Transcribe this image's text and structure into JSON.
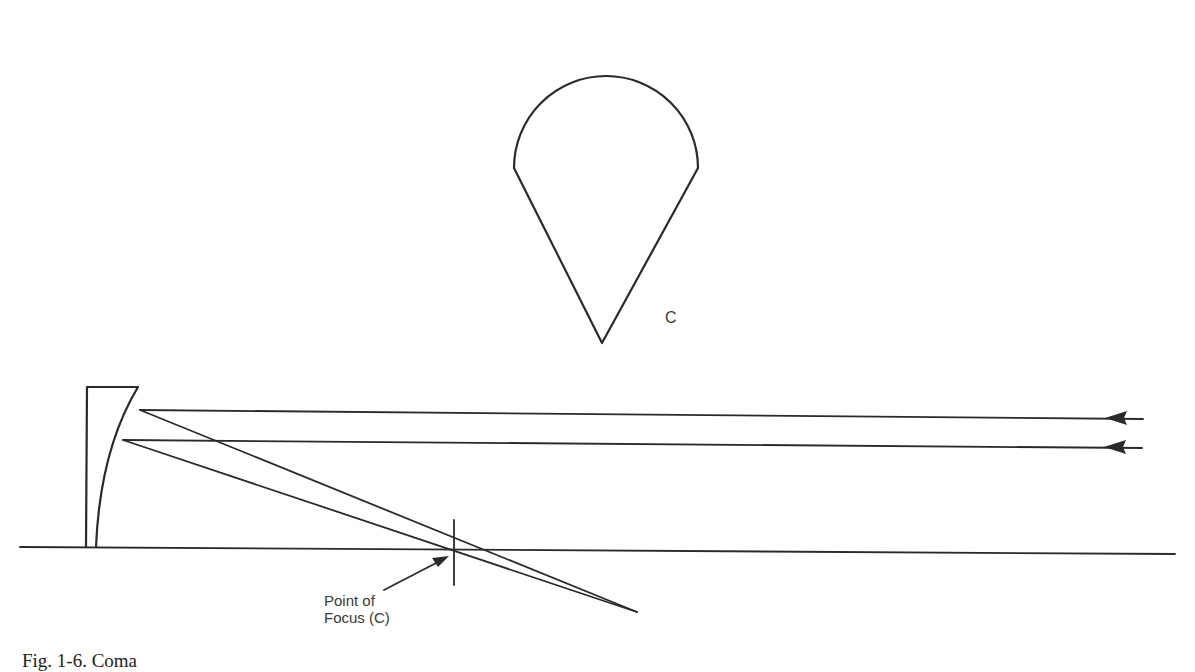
{
  "figure": {
    "pattern_label": "C",
    "focus_label_line1": "Point of",
    "focus_label_line2": "Focus (C)",
    "caption": "Fig. 1-6. Coma"
  },
  "colors": {
    "ink": "#2a2a2a",
    "background": "#ffffff"
  },
  "geometry": {
    "teardrop_tip": [
      602,
      343
    ],
    "teardrop_circle_center": [
      641,
      128
    ],
    "teardrop_circle_radius": 57,
    "axis_y": 548,
    "focus_point": [
      455,
      548
    ],
    "incoming_rays_y": [
      413,
      443
    ],
    "mirror_x": [
      85,
      138
    ]
  }
}
